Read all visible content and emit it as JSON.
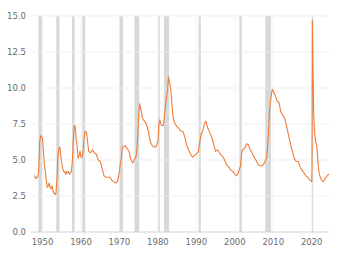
{
  "chart_data": {
    "type": "line",
    "title": "",
    "subtitle": "",
    "xlabel": "",
    "ylabel": "",
    "xlim": [
      1947.0,
      2024.5
    ],
    "ylim": [
      0.0,
      15.0
    ],
    "grid": true,
    "grid_axis": "y",
    "legend": "none",
    "line_color": "#ed7d3a",
    "line_width": 1.1,
    "recession_band_color": "#c8ccce",
    "recession_band_opacity": 0.75,
    "grid_color": "#eeeeee",
    "axis_color": "#cfcfcf",
    "tick_label_color": "#6b6b6b",
    "background": "#ffffff",
    "yticks": [
      0.0,
      2.5,
      5.0,
      7.5,
      10.0,
      12.5,
      15.0
    ],
    "ytick_labels": [
      "0.0",
      "2.5",
      "5.0",
      "7.5",
      "10.0",
      "12.5",
      "15.0"
    ],
    "xticks": [
      1950,
      1960,
      1970,
      1980,
      1990,
      2000,
      2010,
      2020
    ],
    "xtick_labels": [
      "1950",
      "1960",
      "1970",
      "1980",
      "1990",
      "2000",
      "2010",
      "2020"
    ],
    "recession_bands": [
      {
        "start": 1948.92,
        "end": 1949.83
      },
      {
        "start": 1953.58,
        "end": 1954.42
      },
      {
        "start": 1957.67,
        "end": 1958.33
      },
      {
        "start": 1960.33,
        "end": 1961.08
      },
      {
        "start": 1969.92,
        "end": 1970.92
      },
      {
        "start": 1973.92,
        "end": 1975.17
      },
      {
        "start": 1980.08,
        "end": 1980.5
      },
      {
        "start": 1981.58,
        "end": 1982.92
      },
      {
        "start": 1990.58,
        "end": 1991.17
      },
      {
        "start": 2001.17,
        "end": 2001.83
      },
      {
        "start": 2007.92,
        "end": 2009.42
      },
      {
        "start": 2020.08,
        "end": 2020.33
      }
    ],
    "series": [
      {
        "name": "Unemployment Rate",
        "x": [
          1948.0,
          1948.25,
          1948.5,
          1948.75,
          1949.0,
          1949.25,
          1949.5,
          1949.75,
          1950.0,
          1950.25,
          1950.5,
          1950.75,
          1951.0,
          1951.25,
          1951.5,
          1951.75,
          1952.0,
          1952.25,
          1952.5,
          1952.75,
          1953.0,
          1953.25,
          1953.5,
          1953.75,
          1954.0,
          1954.25,
          1954.5,
          1954.75,
          1955.0,
          1955.25,
          1955.5,
          1955.75,
          1956.0,
          1956.25,
          1956.5,
          1956.75,
          1957.0,
          1957.25,
          1957.5,
          1957.75,
          1958.0,
          1958.25,
          1958.5,
          1958.75,
          1959.0,
          1959.25,
          1959.5,
          1959.75,
          1960.0,
          1960.25,
          1960.5,
          1960.75,
          1961.0,
          1961.25,
          1961.5,
          1961.75,
          1962.0,
          1962.5,
          1963.0,
          1963.5,
          1964.0,
          1964.5,
          1965.0,
          1965.5,
          1966.0,
          1966.5,
          1967.0,
          1967.5,
          1968.0,
          1968.5,
          1969.0,
          1969.5,
          1970.0,
          1970.25,
          1970.5,
          1970.75,
          1971.0,
          1971.5,
          1972.0,
          1972.5,
          1973.0,
          1973.5,
          1974.0,
          1974.25,
          1974.5,
          1974.75,
          1975.0,
          1975.25,
          1975.5,
          1975.75,
          1976.0,
          1976.5,
          1977.0,
          1977.5,
          1978.0,
          1978.5,
          1979.0,
          1979.5,
          1980.0,
          1980.25,
          1980.5,
          1980.75,
          1981.0,
          1981.25,
          1981.5,
          1981.75,
          1982.0,
          1982.25,
          1982.5,
          1982.75,
          1983.0,
          1983.25,
          1983.5,
          1983.75,
          1984.0,
          1984.5,
          1985.0,
          1985.5,
          1986.0,
          1986.5,
          1987.0,
          1987.5,
          1988.0,
          1988.5,
          1989.0,
          1989.5,
          1990.0,
          1990.5,
          1990.75,
          1991.0,
          1991.25,
          1991.5,
          1991.75,
          1992.0,
          1992.25,
          1992.5,
          1992.75,
          1993.0,
          1993.5,
          1994.0,
          1994.5,
          1995.0,
          1995.5,
          1996.0,
          1996.5,
          1997.0,
          1997.5,
          1998.0,
          1998.5,
          1999.0,
          1999.5,
          2000.0,
          2000.5,
          2001.0,
          2001.25,
          2001.5,
          2001.75,
          2002.0,
          2002.5,
          2003.0,
          2003.5,
          2004.0,
          2004.5,
          2005.0,
          2005.5,
          2006.0,
          2006.5,
          2007.0,
          2007.5,
          2008.0,
          2008.25,
          2008.5,
          2008.75,
          2009.0,
          2009.25,
          2009.5,
          2009.75,
          2010.0,
          2010.5,
          2011.0,
          2011.5,
          2012.0,
          2012.5,
          2013.0,
          2013.5,
          2014.0,
          2014.5,
          2015.0,
          2015.5,
          2016.0,
          2016.5,
          2017.0,
          2017.5,
          2018.0,
          2018.5,
          2019.0,
          2019.5,
          2020.0,
          2020.08,
          2020.17,
          2020.25,
          2020.33,
          2020.42,
          2020.5,
          2020.58,
          2020.75,
          2021.0,
          2021.25,
          2021.5,
          2021.75,
          2022.0,
          2022.5,
          2023.0,
          2023.5,
          2024.0,
          2024.4
        ],
        "values": [
          3.9,
          3.7,
          3.8,
          3.8,
          4.3,
          6.2,
          6.7,
          6.6,
          6.5,
          5.5,
          4.6,
          4.2,
          3.5,
          3.1,
          3.2,
          3.4,
          3.1,
          3.0,
          3.2,
          2.8,
          2.7,
          2.6,
          2.7,
          3.7,
          5.3,
          5.8,
          5.9,
          5.3,
          4.8,
          4.4,
          4.2,
          4.2,
          4.0,
          4.2,
          4.1,
          4.2,
          4.0,
          4.1,
          4.2,
          4.9,
          6.4,
          7.4,
          7.3,
          6.4,
          6.0,
          5.1,
          5.3,
          5.6,
          5.2,
          5.2,
          5.5,
          6.3,
          6.9,
          7.0,
          6.8,
          6.2,
          5.6,
          5.5,
          5.7,
          5.5,
          5.4,
          5.0,
          4.9,
          4.4,
          3.9,
          3.8,
          3.8,
          3.8,
          3.6,
          3.5,
          3.4,
          3.5,
          4.2,
          4.8,
          5.1,
          5.9,
          5.9,
          6.0,
          5.8,
          5.6,
          5.0,
          4.8,
          5.1,
          5.2,
          5.6,
          6.6,
          8.1,
          8.9,
          8.6,
          8.3,
          7.9,
          7.7,
          7.5,
          7.0,
          6.3,
          6.0,
          5.9,
          5.9,
          6.3,
          7.5,
          7.8,
          7.5,
          7.4,
          7.4,
          7.4,
          8.3,
          8.8,
          9.4,
          9.8,
          10.8,
          10.4,
          10.1,
          9.4,
          8.5,
          7.9,
          7.5,
          7.3,
          7.2,
          7.0,
          7.0,
          6.6,
          6.0,
          5.7,
          5.4,
          5.2,
          5.3,
          5.4,
          5.6,
          6.0,
          6.4,
          6.8,
          6.9,
          7.1,
          7.4,
          7.6,
          7.7,
          7.4,
          7.2,
          6.9,
          6.6,
          6.1,
          5.6,
          5.7,
          5.5,
          5.3,
          5.2,
          4.9,
          4.6,
          4.5,
          4.3,
          4.2,
          4.0,
          3.9,
          4.2,
          4.4,
          4.6,
          5.4,
          5.7,
          5.8,
          6.1,
          6.1,
          5.7,
          5.5,
          5.2,
          5.0,
          4.7,
          4.6,
          4.6,
          4.7,
          5.0,
          5.1,
          5.8,
          6.8,
          8.3,
          9.0,
          9.5,
          9.9,
          9.8,
          9.5,
          9.1,
          9.0,
          8.3,
          8.1,
          7.9,
          7.3,
          6.7,
          6.1,
          5.6,
          5.1,
          4.9,
          4.9,
          4.5,
          4.3,
          4.1,
          3.9,
          3.8,
          3.6,
          3.5,
          4.4,
          14.7,
          13.2,
          11.1,
          10.2,
          8.4,
          7.9,
          6.9,
          6.3,
          6.1,
          5.4,
          4.5,
          4.0,
          3.6,
          3.5,
          3.7,
          3.9,
          4.0
        ]
      }
    ]
  },
  "axes": {
    "plot_left": 31,
    "plot_right": 329,
    "plot_top": 16,
    "plot_bottom": 232
  }
}
